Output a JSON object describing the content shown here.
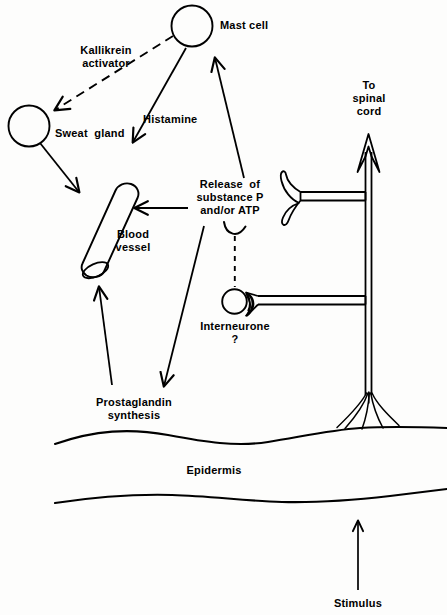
{
  "figure": {
    "type": "diagram",
    "background_color": "#fdfdfc",
    "ink_color": "#000000"
  },
  "labels": {
    "mast_cell": "Mast cell",
    "kallikrein_activator": "Kallikrein\nactivator",
    "sweat_gland": "Sweat  gland",
    "histamine": "Histamine",
    "blood_vessel": "Blood\nvessel",
    "release_substance": "Release  of\nsubstance P\nand/or ATP",
    "interneurone": "Interneurone\n?",
    "to_spinal_cord": "To\nspinal\ncord",
    "prostaglandin_synthesis": "Prostaglandin\nsynthesis",
    "epidermis": "Epidermis",
    "stimulus": "Stimulus"
  },
  "nodes": [
    {
      "id": "mast-cell",
      "kind": "circle",
      "label": "Mast cell",
      "cx": 192,
      "cy": 26,
      "r": 20
    },
    {
      "id": "sweat-gland",
      "kind": "circle",
      "label": "Sweat  gland",
      "cx": 29,
      "cy": 126,
      "r": 20
    },
    {
      "id": "blood-vessel",
      "kind": "cylinder",
      "label": "Blood vessel",
      "x": 90,
      "y": 180,
      "angle": -20
    },
    {
      "id": "interneurone",
      "kind": "circle-with-crescent",
      "label": "Interneurone ?",
      "cx": 235,
      "cy": 302,
      "r": 12
    },
    {
      "id": "nerve-trunk",
      "kind": "double-line-axon",
      "label": "To spinal cord",
      "x": 368
    },
    {
      "id": "epidermis-band",
      "kind": "wavy-band",
      "label": "Epidermis"
    }
  ],
  "arrows": [
    {
      "id": "mast-to-sweat",
      "label": "Kallikrein activator",
      "style": "dashed",
      "from": "mast-cell",
      "to": "sweat-gland"
    },
    {
      "id": "mast-to-vessel",
      "label": "Histamine",
      "style": "solid",
      "from": "mast-cell",
      "to": "blood-vessel"
    },
    {
      "id": "sweat-to-vessel",
      "label": "",
      "style": "solid",
      "from": "sweat-gland",
      "to": "blood-vessel"
    },
    {
      "id": "release-to-mast",
      "label": "",
      "style": "solid",
      "from": "release-substance",
      "to": "mast-cell"
    },
    {
      "id": "release-to-vessel",
      "label": "",
      "style": "solid",
      "from": "release-substance",
      "to": "blood-vessel"
    },
    {
      "id": "release-to-prostaglandin",
      "label": "",
      "style": "solid",
      "from": "release-substance",
      "to": "prostaglandin-synthesis"
    },
    {
      "id": "prostaglandin-to-vessel",
      "label": "",
      "style": "solid",
      "from": "prostaglandin-synthesis",
      "to": "blood-vessel"
    },
    {
      "id": "release-to-interneurone",
      "label": "",
      "style": "dashed",
      "from": "release-substance",
      "to": "interneurone"
    },
    {
      "id": "stimulus-arrow",
      "label": "Stimulus",
      "style": "solid",
      "from": "stimulus",
      "to": "epidermis-band"
    },
    {
      "id": "axon-to-spinal-cord",
      "label": "To spinal cord",
      "style": "outline",
      "from": "nerve-trunk",
      "to": "spinal-cord"
    }
  ]
}
